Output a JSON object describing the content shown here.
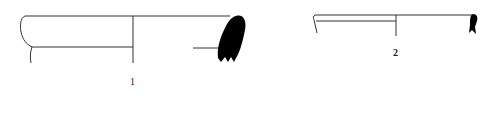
{
  "figure": {
    "type": "archaeological pottery profile drawing",
    "profiles": [
      {
        "id": 1,
        "label": "1",
        "color": "#000000"
      },
      {
        "id": 2,
        "label": "2",
        "color": "#000000"
      }
    ]
  }
}
